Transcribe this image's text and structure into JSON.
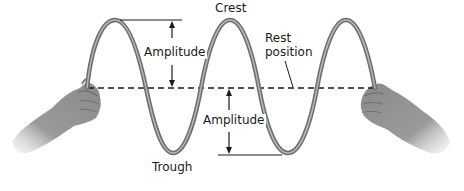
{
  "diagram": {
    "labels": {
      "crest": "Crest",
      "trough": "Trough",
      "amplitude_top": "Amplitude",
      "amplitude_bottom": "Amplitude",
      "rest_position_line1": "Rest",
      "rest_position_line2": "position"
    },
    "colors": {
      "rope": "#7a7a7a",
      "rope_highlight": "#b5b5b5",
      "lines": "#1a1a1a",
      "hand": "#8c8c8c",
      "background": "#ffffff"
    },
    "elements": {
      "left_hand": "hand-holding-rope-left",
      "right_hand": "hand-holding-rope-right",
      "rest_line": "dashed-rest-position-line"
    }
  }
}
